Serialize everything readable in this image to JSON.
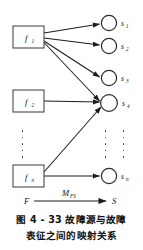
{
  "figure": {
    "caption_line_1": "图 4 - 33   故障源与故障",
    "caption_line_2": "表征之间的映射关系",
    "caption_number": "4 - 33",
    "caption_label": "图",
    "caption_title": "故障源与故障表征之间的映射关系"
  },
  "diagram_data": {
    "type": "bipartite-mapping-diagram",
    "left_set_name": "F",
    "right_set_name": "S",
    "mapping_label": "M",
    "mapping_label_subscript": "FS",
    "left_nodes": [
      {
        "id": "f1",
        "label": "f",
        "subscript": "1",
        "shape": "rectangle",
        "cx": 28,
        "cy": 37
      },
      {
        "id": "f2",
        "label": "f",
        "subscript": "2",
        "shape": "rectangle",
        "cx": 28,
        "cy": 101
      },
      {
        "id": "fn",
        "label": "f",
        "subscript": "n",
        "shape": "rectangle",
        "cx": 28,
        "cy": 176
      }
    ],
    "right_nodes": [
      {
        "id": "s1",
        "label": "s",
        "subscript": "1",
        "shape": "circle",
        "cx": 109,
        "cy": 23
      },
      {
        "id": "s2",
        "label": "s",
        "subscript": "2",
        "shape": "circle",
        "cx": 109,
        "cy": 45
      },
      {
        "id": "s3",
        "label": "s",
        "subscript": "3",
        "shape": "circle",
        "cx": 109,
        "cy": 79
      },
      {
        "id": "s4",
        "label": "s",
        "subscript": "4",
        "shape": "circle",
        "cx": 109,
        "cy": 103
      },
      {
        "id": "sn",
        "label": "s",
        "subscript": "n",
        "shape": "circle",
        "cx": 109,
        "cy": 176
      }
    ],
    "edges": [
      {
        "from": "f1",
        "to": "s1"
      },
      {
        "from": "f1",
        "to": "s2"
      },
      {
        "from": "f1",
        "to": "s3"
      },
      {
        "from": "f1",
        "to": "s4"
      },
      {
        "from": "f2",
        "to": "s4"
      },
      {
        "from": "fn",
        "to": "s4"
      },
      {
        "from": "fn",
        "to": "sn"
      }
    ],
    "ellipses": [
      {
        "id": "dots-left",
        "orientation": "vertical",
        "count": 5
      },
      {
        "id": "dots-right-a",
        "orientation": "vertical",
        "count": 5
      },
      {
        "id": "dots-right-b",
        "orientation": "vertical",
        "count": 5
      }
    ],
    "summary_arrow": {
      "from_label": "F",
      "to_label": "S",
      "over_label": "M",
      "over_label_subscript": "FS"
    },
    "colors": {
      "stroke": "#1c1c1c",
      "box_stroke": "#4a4a4a",
      "background": "#ffffff",
      "text": "#111111"
    }
  }
}
